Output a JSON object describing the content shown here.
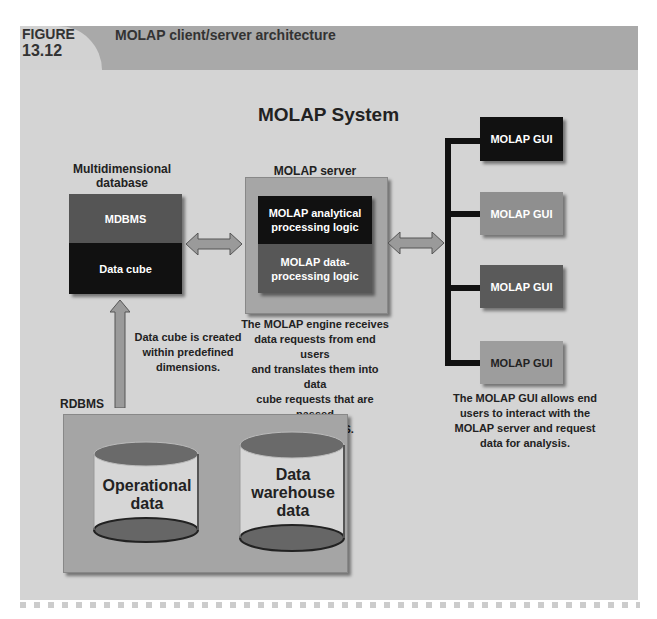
{
  "header": {
    "figure_label_line1": "FIGURE",
    "figure_label_line2": "13.12",
    "title": "MOLAP client/server architecture"
  },
  "diagram": {
    "title": "MOLAP System",
    "multidimensional_db": {
      "label_line1": "Multidimensional",
      "label_line2": "database",
      "top_box": "MDBMS",
      "bottom_box": "Data cube"
    },
    "molap_server": {
      "label": "MOLAP server",
      "top_box_line1": "MOLAP analytical",
      "top_box_line2": "processing logic",
      "bottom_box_line1": "MOLAP data-",
      "bottom_box_line2": "processing logic",
      "caption": [
        "The MOLAP engine receives",
        "data requests from end users",
        "and translates them into data",
        "cube requests that are passed",
        "to the MDBMS."
      ]
    },
    "data_cube_caption": [
      "Data cube is created",
      "within predefined",
      "dimensions."
    ],
    "gui_boxes": [
      {
        "label": "MOLAP GUI",
        "color": "#111111"
      },
      {
        "label": "MOLAP GUI",
        "color": "#8f8f8f"
      },
      {
        "label": "MOLAP GUI",
        "color": "#5a5a5a"
      },
      {
        "label": "MOLAP GUI",
        "color": "#9d9d9d"
      }
    ],
    "gui_caption": [
      "The MOLAP GUI allows end",
      "users to interact with the",
      "MOLAP server and request",
      "data for analysis."
    ],
    "rdbms": {
      "label": "RDBMS",
      "cylinders": [
        {
          "line1": "Operational",
          "line2": "data",
          "line3": ""
        },
        {
          "line1": "Data",
          "line2": "warehouse",
          "line3": "data"
        }
      ]
    }
  },
  "colors": {
    "panel": "#d4d4d4",
    "header_bar": "#a9a9a9",
    "mdbms": "#555555",
    "black_box": "#111111",
    "arrow": "#9a9a9a"
  }
}
